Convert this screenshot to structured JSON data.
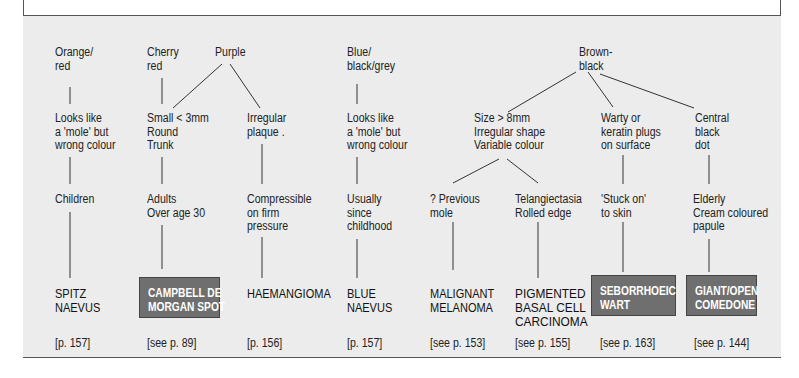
{
  "diagram": {
    "colour_headers": [
      {
        "id": "orange-red",
        "text": "Orange/\nred"
      },
      {
        "id": "cherry-red",
        "text": "Cherry\nred"
      },
      {
        "id": "purple",
        "text": "Purple"
      },
      {
        "id": "blue-black-grey",
        "text": "Blue/\nblack/grey"
      },
      {
        "id": "brown-black",
        "text": "Brown-\nblack"
      }
    ],
    "features": [
      {
        "id": "spitz-feature",
        "text": "Looks like\na 'mole' but\nwrong colour"
      },
      {
        "id": "campbell-feature",
        "text": "Small < 3mm\nRound\nTrunk"
      },
      {
        "id": "haem-feature",
        "text": "Irregular\nplaque ."
      },
      {
        "id": "blue-feature",
        "text": "Looks like\na 'mole' but\nwrong colour"
      },
      {
        "id": "size-feature",
        "text": "Size > 8mm\nIrregular shape\nVariable colour"
      },
      {
        "id": "warty-feature",
        "text": "Warty or\nkeratin plugs\non surface"
      },
      {
        "id": "central-feature",
        "text": "Central\nblack\ndot"
      }
    ],
    "clues": [
      {
        "id": "children",
        "text": "Children"
      },
      {
        "id": "adults",
        "text": "Adults\nOver age 30"
      },
      {
        "id": "compressible",
        "text": "Compressible\non firm\npressure"
      },
      {
        "id": "usually",
        "text": "Usually\nsince\nchildhood"
      },
      {
        "id": "previous-mole",
        "text": "? Previous\nmole"
      },
      {
        "id": "telangiectasia",
        "text": "Telangiectasia\nRolled edge"
      },
      {
        "id": "stuck-on",
        "text": "'Stuck on'\nto skin"
      },
      {
        "id": "elderly",
        "text": "Elderly\nCream coloured\npapule"
      }
    ],
    "diagnoses": [
      {
        "id": "spitz",
        "text": "SPITZ\nNAEVUS",
        "highlighted": false
      },
      {
        "id": "campbell",
        "text": "CAMPBELL DE\nMORGAN SPOT",
        "highlighted": true
      },
      {
        "id": "haemangioma",
        "text": "HAEMANGIOMA",
        "highlighted": false
      },
      {
        "id": "blue-naevus",
        "text": "BLUE\nNAEVUS",
        "highlighted": false
      },
      {
        "id": "melanoma",
        "text": "MALIGNANT\nMELANOMA",
        "highlighted": false
      },
      {
        "id": "bcc",
        "text": "PIGMENTED\nBASAL CELL\nCARCINOMA",
        "highlighted": false
      },
      {
        "id": "seb-wart",
        "text": "SEBORRHOEIC\nWART",
        "highlighted": true
      },
      {
        "id": "comedone",
        "text": "GIANT/OPEN\nCOMEDONE",
        "highlighted": true
      }
    ],
    "page_refs": [
      "[p. 157]",
      "[see p. 89]",
      "[p. 156]",
      "[p. 157]",
      "[see p. 153]",
      "[see p. 155]",
      "[see p. 163]",
      "[see p. 144]"
    ],
    "colors": {
      "panel": "#ececec",
      "frame": "#555555",
      "highlight_box": "#6f6f6f",
      "highlight_text": "#ffffff"
    }
  }
}
